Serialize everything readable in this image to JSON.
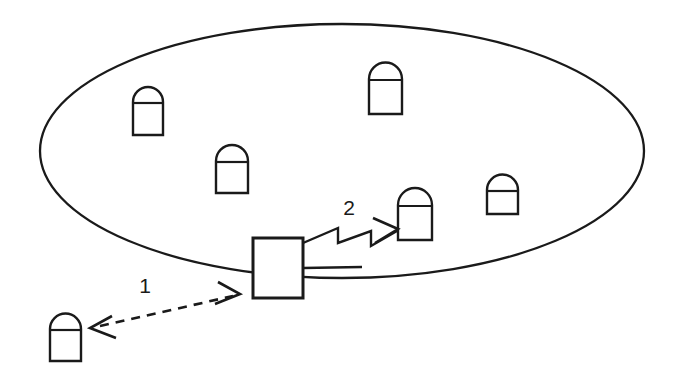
{
  "diagram": {
    "colors": {
      "ink": "#1a1a1a",
      "background": "#ffffff"
    },
    "coverage_area": {
      "shape_name": "coverage-ellipse",
      "cx": 342,
      "cy": 151,
      "rx": 302,
      "ry": 127
    },
    "gateway": {
      "shape_name": "gateway-rectangle",
      "x": 253,
      "y": 238,
      "width": 50,
      "height": 60
    },
    "devices": [
      {
        "id": "device-1",
        "x": 133,
        "y": 87,
        "w": 30,
        "h": 48
      },
      {
        "id": "device-2",
        "x": 216,
        "y": 145,
        "w": 32,
        "h": 48
      },
      {
        "id": "device-3",
        "x": 369,
        "y": 62,
        "w": 33,
        "h": 52
      },
      {
        "id": "device-4",
        "x": 487,
        "y": 174,
        "w": 31,
        "h": 40
      },
      {
        "id": "device-5",
        "x": 398,
        "y": 188,
        "w": 34,
        "h": 52
      },
      {
        "id": "device-6",
        "x": 50,
        "y": 313,
        "w": 31,
        "h": 48
      }
    ],
    "links": [
      {
        "id": "link-1",
        "label": "1",
        "style": "dashed-double-arrow",
        "label_x": 145,
        "label_y": 291,
        "from": {
          "x": 93,
          "y": 328
        },
        "to": {
          "x": 237,
          "y": 294
        }
      },
      {
        "id": "link-2",
        "label": "2",
        "style": "zigzag-single-arrow",
        "label_x": 349,
        "label_y": 214,
        "from": {
          "x": 303,
          "y": 243
        },
        "to": {
          "x": 398,
          "y": 228
        }
      }
    ],
    "wired_link": {
      "id": "wired-link",
      "style": "solid",
      "from": {
        "x": 303,
        "y": 268
      },
      "to": {
        "x": 360,
        "y": 268
      }
    }
  }
}
